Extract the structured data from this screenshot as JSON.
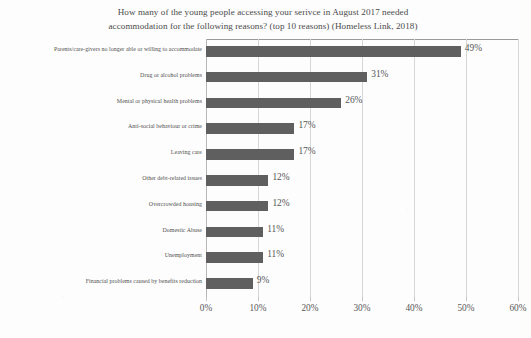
{
  "chart_data": {
    "type": "bar",
    "orientation": "horizontal",
    "title": "How many of the young people accessing your serivce in August 2017 needed accommodation for the following reasons? (top 10 reasons) (Homeless Link, 2018)",
    "title_line1": "How many of the young people accessing your serivce in August 2017 needed",
    "title_line2": "accommodation for the following reasons? (top 10 reasons) (Homeless Link, 2018)",
    "xlabel": "",
    "ylabel": "",
    "categories": [
      "Parents/care-givers no longer able or willing to accommodate",
      "Drug or alcohol problems",
      "Mental or physical health problems",
      "Anti-social behaviour or crime",
      "Leaving care",
      "Other debt-related issues",
      "Overcrowded housing",
      "Domestic Abuse",
      "Unemployment",
      "Financial problems caused by benefits reduction"
    ],
    "values": [
      49,
      31,
      26,
      17,
      17,
      12,
      12,
      11,
      11,
      9
    ],
    "data_labels": [
      "49%",
      "31%",
      "26%",
      "17%",
      "17%",
      "12%",
      "12%",
      "11%",
      "11%",
      "9%"
    ],
    "xlim": [
      0,
      60
    ],
    "xticks": [
      0,
      10,
      20,
      30,
      40,
      50,
      60
    ],
    "xtick_labels": [
      "0%",
      "10%",
      "20%",
      "30%",
      "40%",
      "50%",
      "60%"
    ],
    "grid": true,
    "grid_axis": "x",
    "legend": false,
    "bar_color": "#5f5f5f",
    "gridline_color": "#d6d6d6",
    "text_color": "#4f4f4f",
    "background_color": "#fdfdfd"
  }
}
